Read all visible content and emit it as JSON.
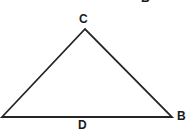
{
  "figure": {
    "kind": "geometry-triangle-diagram",
    "width": 187,
    "height": 134,
    "background_color": "#ffffff",
    "stroke_color": "#252525",
    "stroke_width": 1.8,
    "label_color": "#1a1a1a"
  },
  "triangle": {
    "name": "triangle-outline",
    "vertices": [
      {
        "id": "left",
        "x": 2,
        "y": 117
      },
      {
        "id": "apex",
        "x": 85,
        "y": 29
      },
      {
        "id": "right",
        "x": 172,
        "y": 117
      }
    ],
    "points_attr": "2,117 85,29 172,117"
  },
  "labels": {
    "apex": "C",
    "base": "D",
    "right_vertex": "B",
    "top_clipped": "B"
  }
}
